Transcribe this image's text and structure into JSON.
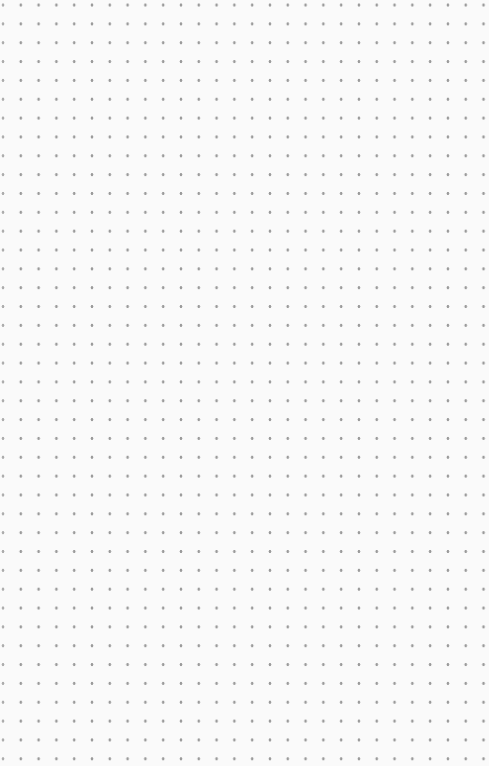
{
  "canvas": {
    "pattern": "dot-grid",
    "background_color": "#fafafa",
    "dot_color": "#9a9a9a",
    "dot_spacing_x": 17.8,
    "dot_spacing_y": 18.85,
    "columns": 28,
    "rows": 41
  }
}
